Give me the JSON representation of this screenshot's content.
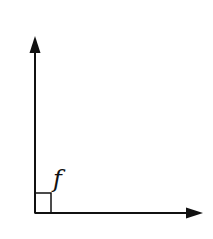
{
  "diagram": {
    "type": "right-angle",
    "angle_label": "f",
    "angle_degrees": 90,
    "colors": {
      "stroke": "#111111",
      "background": "#ffffff"
    },
    "vertex": {
      "x": 35,
      "y": 213
    },
    "vertical_ray_tip": {
      "x": 35,
      "y": 36
    },
    "horizontal_ray_tip": {
      "x": 203,
      "y": 213
    },
    "right_angle_marker_size": 16
  }
}
